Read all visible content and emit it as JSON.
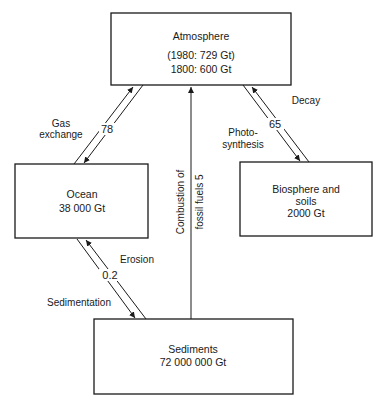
{
  "diagram": {
    "type": "carbon-cycle",
    "nodes": {
      "atmosphere": {
        "title": "Atmosphere",
        "line1": "(1980: 729 Gt)",
        "line2": "1800: 600 Gt"
      },
      "ocean": {
        "title": "Ocean",
        "value": "38 000 Gt"
      },
      "biosphere": {
        "title": "Biosphere and",
        "title2": "soils",
        "value": "2000 Gt"
      },
      "sediments": {
        "title": "Sediments",
        "value": "72 000 000 Gt"
      }
    },
    "flows": {
      "gas_exchange": {
        "label1": "Gas",
        "label2": "exchange",
        "value": "78"
      },
      "decay_photosynthesis": {
        "decay_label": "Decay",
        "photo_label1": "Photo-",
        "photo_label2": "synthesis",
        "value": "65"
      },
      "fossil_fuels": {
        "label1": "Combustion of",
        "label2": "fossil fuels 5"
      },
      "erosion_sedimentation": {
        "erosion_label": "Erosion",
        "sedimentation_label": "Sedimentation",
        "value": "0.2"
      }
    }
  }
}
